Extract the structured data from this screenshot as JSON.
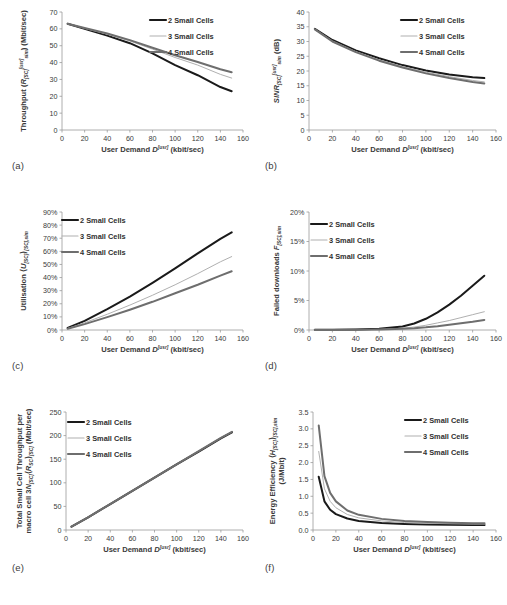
{
  "figure": {
    "panels": [
      {
        "tag": "(a)",
        "name": "throughput",
        "ylabel_parts": [
          "Throughput (",
          "R",
          "[SC]",
          "[usr]",
          "sim",
          ") (Mbit/sec)"
        ],
        "ylabel_plain": "Throughput (R[SC][usr]sim) (Mbit/sec)",
        "xlabel_plain": "User Demand D[usr] (kbit/sec)"
      },
      {
        "tag": "(b)",
        "name": "sinr",
        "ylabel_plain": "SINR[SC][usr]sim (dB)",
        "xlabel_plain": "User Demand D[usr] (kbit/sec)"
      },
      {
        "tag": "(c)",
        "name": "utilisation",
        "ylabel_plain": "Utilisation (U[SC])[SC],sim",
        "xlabel_plain": "User Demand D[usr] (kbit/sec)"
      },
      {
        "tag": "(d)",
        "name": "failed-downloads",
        "ylabel_plain": "Failed downloads F[SC],sim",
        "xlabel_plain": "User Demand D[usr] (kbit/sec)"
      },
      {
        "tag": "(e)",
        "name": "total-small-cell-throughput",
        "ylabel_plain": "Total Small Cell Throughput per macro cell 3N[SC](R[SC])[SC] (Mbit/sec)",
        "xlabel_plain": "User Demand D[usr] (kbit/sec)"
      },
      {
        "tag": "(f)",
        "name": "energy-efficiency",
        "ylabel_plain": "Energy Efficiency (H[SC])[SC],sim (J/Mbit)",
        "xlabel_plain": "User Demand D[usr] (kbit/sec)"
      }
    ],
    "legend_labels": [
      "2 Small Cells",
      "3 Small Cells",
      "4 Small Cells"
    ],
    "series_colors": [
      "#1a1a1a",
      "#b0b0b0",
      "#6e6e6e"
    ],
    "xaxis_common": {
      "label": "User Demand D[usr] (kbit/sec)",
      "ticks": [
        0,
        20,
        40,
        60,
        80,
        100,
        120,
        140,
        160
      ],
      "min": 0,
      "max": 160
    }
  },
  "chart_data": [
    {
      "type": "line",
      "panel": "(a)",
      "title": "Throughput vs User Demand",
      "xlabel": "User Demand D[usr] (kbit/sec)",
      "ylabel": "Throughput (R[SC][usr]sim) (Mbit/sec)",
      "xlim": [
        0,
        160
      ],
      "ylim": [
        0,
        70
      ],
      "xticks": [
        0,
        20,
        40,
        60,
        80,
        100,
        120,
        140,
        160
      ],
      "yticks": [
        0,
        10,
        20,
        30,
        40,
        50,
        60,
        70
      ],
      "grid": false,
      "legend_position": "top-right",
      "x": [
        5,
        20,
        40,
        60,
        80,
        100,
        120,
        140,
        150
      ],
      "series": [
        {
          "name": "2 Small Cells",
          "color": "#1a1a1a",
          "width": 2.0,
          "values": [
            63.0,
            60.0,
            56.0,
            51.5,
            45.5,
            38.5,
            32.5,
            25.5,
            23.0
          ]
        },
        {
          "name": "3 Small Cells",
          "color": "#b0b0b0",
          "width": 1.0,
          "values": [
            63.0,
            60.3,
            56.8,
            52.8,
            48.0,
            43.0,
            38.5,
            33.0,
            30.8
          ]
        },
        {
          "name": "4 Small Cells",
          "color": "#6e6e6e",
          "width": 2.0,
          "values": [
            63.0,
            60.5,
            57.2,
            53.3,
            48.8,
            44.3,
            40.3,
            36.0,
            34.3
          ]
        }
      ]
    },
    {
      "type": "line",
      "panel": "(b)",
      "title": "SINR vs User Demand",
      "xlabel": "User Demand D[usr] (kbit/sec)",
      "ylabel": "SINR[SC][usr]sim (dB)",
      "xlim": [
        0,
        160
      ],
      "ylim": [
        0,
        40
      ],
      "xticks": [
        0,
        20,
        40,
        60,
        80,
        100,
        120,
        140,
        160
      ],
      "yticks": [
        0,
        5,
        10,
        15,
        20,
        25,
        30,
        35,
        40
      ],
      "grid": false,
      "legend_position": "top-right",
      "x": [
        5,
        20,
        40,
        60,
        80,
        100,
        120,
        140,
        150
      ],
      "series": [
        {
          "name": "2 Small Cells",
          "color": "#1a1a1a",
          "width": 2.0,
          "values": [
            34.3,
            30.5,
            27.0,
            24.3,
            22.0,
            20.2,
            18.8,
            17.9,
            17.6
          ]
        },
        {
          "name": "3 Small Cells",
          "color": "#b0b0b0",
          "width": 1.0,
          "values": [
            34.2,
            30.2,
            26.6,
            23.8,
            21.5,
            19.6,
            18.1,
            16.8,
            16.3
          ]
        },
        {
          "name": "4 Small Cells",
          "color": "#6e6e6e",
          "width": 2.0,
          "values": [
            34.1,
            30.0,
            26.4,
            23.5,
            21.2,
            19.2,
            17.6,
            16.3,
            15.8
          ]
        }
      ]
    },
    {
      "type": "line",
      "panel": "(c)",
      "title": "Utilisation vs User Demand",
      "xlabel": "User Demand D[usr] (kbit/sec)",
      "ylabel": "Utilisation (U[SC])[SC],sim",
      "xlim": [
        0,
        160
      ],
      "ylim": [
        0,
        90
      ],
      "xticks": [
        0,
        20,
        40,
        60,
        80,
        100,
        120,
        140,
        160
      ],
      "yticks": [
        0,
        10,
        20,
        30,
        40,
        50,
        60,
        70,
        80,
        90
      ],
      "ytick_labels": [
        "0%",
        "10%",
        "20%",
        "30%",
        "40%",
        "50%",
        "60%",
        "70%",
        "80%",
        "90%"
      ],
      "grid": false,
      "legend_position": "top-left",
      "x": [
        5,
        20,
        40,
        60,
        80,
        100,
        120,
        140,
        150
      ],
      "series": [
        {
          "name": "2 Small Cells",
          "color": "#1a1a1a",
          "width": 2.0,
          "values": [
            1.5,
            7.0,
            16.0,
            25.5,
            36.0,
            47.0,
            58.5,
            69.5,
            74.5
          ]
        },
        {
          "name": "3 Small Cells",
          "color": "#b0b0b0",
          "width": 1.0,
          "values": [
            1.2,
            5.5,
            12.0,
            19.0,
            26.5,
            34.5,
            43.0,
            52.0,
            56.0
          ]
        },
        {
          "name": "4 Small Cells",
          "color": "#6e6e6e",
          "width": 2.0,
          "values": [
            1.0,
            4.5,
            9.8,
            15.5,
            21.5,
            28.0,
            34.5,
            41.5,
            44.8
          ]
        }
      ]
    },
    {
      "type": "line",
      "panel": "(d)",
      "title": "Failed downloads vs User Demand",
      "xlabel": "User Demand D[usr] (kbit/sec)",
      "ylabel": "Failed downloads F[SC],sim",
      "xlim": [
        0,
        160
      ],
      "ylim": [
        0,
        20
      ],
      "xticks": [
        0,
        20,
        40,
        60,
        80,
        100,
        120,
        140,
        160
      ],
      "yticks": [
        0,
        5,
        10,
        15,
        20
      ],
      "ytick_labels": [
        "0%",
        "5%",
        "10%",
        "15%",
        "20%"
      ],
      "grid": false,
      "legend_position": "top-left",
      "x": [
        5,
        20,
        40,
        60,
        80,
        90,
        100,
        110,
        120,
        130,
        140,
        150
      ],
      "series": [
        {
          "name": "2 Small Cells",
          "color": "#1a1a1a",
          "width": 2.0,
          "values": [
            0.05,
            0.05,
            0.1,
            0.2,
            0.6,
            1.1,
            1.9,
            3.0,
            4.3,
            5.8,
            7.5,
            9.2
          ]
        },
        {
          "name": "3 Small Cells",
          "color": "#b0b0b0",
          "width": 1.0,
          "values": [
            0.03,
            0.03,
            0.05,
            0.1,
            0.3,
            0.5,
            0.8,
            1.2,
            1.6,
            2.1,
            2.6,
            3.1
          ]
        },
        {
          "name": "4 Small Cells",
          "color": "#6e6e6e",
          "width": 2.0,
          "values": [
            0.02,
            0.02,
            0.04,
            0.08,
            0.2,
            0.3,
            0.45,
            0.65,
            0.9,
            1.15,
            1.4,
            1.7
          ]
        }
      ]
    },
    {
      "type": "line",
      "panel": "(e)",
      "title": "Total Small Cell Throughput per macro cell",
      "xlabel": "User Demand D[usr] (kbit/sec)",
      "ylabel": "Total Small Cell Throughput per macro cell 3N[SC](R[SC])[SC] (Mbit/sec)",
      "xlim": [
        0,
        160
      ],
      "ylim": [
        0,
        250
      ],
      "xticks": [
        0,
        20,
        40,
        60,
        80,
        100,
        120,
        140,
        160
      ],
      "yticks": [
        0,
        50,
        100,
        150,
        200,
        250
      ],
      "grid": false,
      "legend_position": "top-left",
      "x": [
        5,
        20,
        40,
        60,
        80,
        100,
        120,
        140,
        150
      ],
      "series": [
        {
          "name": "2 Small Cells",
          "color": "#1a1a1a",
          "width": 2.0,
          "values": [
            7,
            27,
            55,
            83,
            111,
            139,
            166,
            194,
            207
          ]
        },
        {
          "name": "3 Small Cells",
          "color": "#b0b0b0",
          "width": 1.0,
          "values": [
            7,
            27,
            55,
            83,
            111,
            139,
            167,
            195,
            208
          ]
        },
        {
          "name": "4 Small Cells",
          "color": "#6e6e6e",
          "width": 2.0,
          "values": [
            7,
            27,
            55,
            83,
            111,
            139,
            167,
            195,
            208
          ]
        }
      ]
    },
    {
      "type": "line",
      "panel": "(f)",
      "title": "Energy Efficiency vs User Demand",
      "xlabel": "User Demand D[usr] (kbit/sec)",
      "ylabel": "Energy Efficiency (H[SC])[SC],sim (J/Mbit)",
      "xlim": [
        0,
        160
      ],
      "ylim": [
        0,
        3.5
      ],
      "xticks": [
        0,
        20,
        40,
        60,
        80,
        100,
        120,
        140,
        160
      ],
      "yticks": [
        0.0,
        0.5,
        1.0,
        1.5,
        2.0,
        2.5,
        3.0,
        3.5
      ],
      "ytick_labels": [
        "0.0",
        "0.5",
        "1.0",
        "1.5",
        "2.0",
        "2.5",
        "3.0",
        "3.5"
      ],
      "grid": false,
      "legend_position": "top-right",
      "x": [
        5,
        10,
        15,
        20,
        30,
        40,
        60,
        80,
        100,
        120,
        140,
        150
      ],
      "series": [
        {
          "name": "2 Small Cells",
          "color": "#1a1a1a",
          "width": 2.0,
          "values": [
            1.58,
            0.85,
            0.6,
            0.47,
            0.34,
            0.27,
            0.21,
            0.18,
            0.165,
            0.155,
            0.15,
            0.15
          ]
        },
        {
          "name": "3 Small Cells",
          "color": "#b0b0b0",
          "width": 1.0,
          "values": [
            2.33,
            1.22,
            0.85,
            0.66,
            0.46,
            0.36,
            0.27,
            0.22,
            0.2,
            0.185,
            0.175,
            0.175
          ]
        },
        {
          "name": "4 Small Cells",
          "color": "#6e6e6e",
          "width": 2.0,
          "values": [
            3.1,
            1.6,
            1.1,
            0.85,
            0.58,
            0.45,
            0.33,
            0.27,
            0.235,
            0.215,
            0.2,
            0.2
          ]
        }
      ]
    }
  ]
}
